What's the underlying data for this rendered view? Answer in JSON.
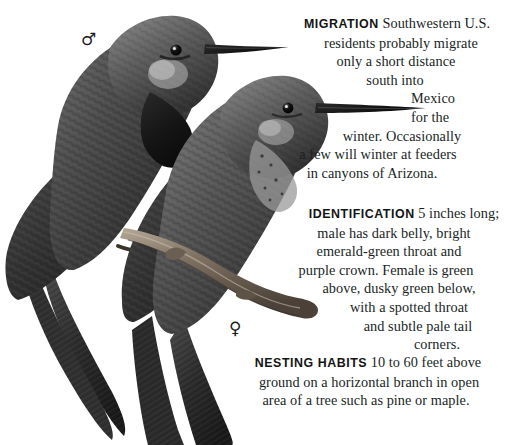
{
  "page": {
    "background_color": "#ffffff",
    "text_color": "#201f1f",
    "heading_color": "#141414"
  },
  "illustration": {
    "name": "two-hummingbirds-perched-on-branch",
    "style": "grayscale-engraving",
    "colors": {
      "feather_dark": "#2a2a2a",
      "feather_mid": "#4a4a4a",
      "feather_light": "#8e8e8e",
      "highlight": "#c9c9c9",
      "beak": "#1a1a1a",
      "branch": "#6d6257",
      "branch_light": "#a2968a",
      "eye": "#0d0d0d"
    },
    "birds": [
      {
        "label": "male",
        "symbol": "♂"
      },
      {
        "label": "female",
        "symbol": "♀"
      }
    ]
  },
  "symbols": {
    "male": "♂",
    "female": "♀"
  },
  "text_blocks": {
    "migration": {
      "lead": "MIGRATION",
      "lines": [
        "Southwestern U.S.",
        "residents probably migrate",
        "only a short distance",
        "south into",
        "Mexico",
        "for the",
        "winter. Occasionally",
        "a few will winter at feeders",
        "in canyons of Arizona."
      ],
      "full_text": "MIGRATION Southwestern U.S. residents probably migrate only a short distance south into Mexico for the winter. Occasionally a few will winter at feeders in canyons of Arizona."
    },
    "identification": {
      "lead": "IDENTIFICATION",
      "lines": [
        "5 inches long;",
        "male has dark belly, bright",
        "emerald-green throat and",
        "purple crown. Female is green",
        "above, dusky green below,",
        "with a spotted throat",
        "and subtle pale tail",
        "corners."
      ],
      "full_text": "IDENTIFICATION 5 inches long; male has dark belly, bright emerald-green throat and purple crown. Female is green above, dusky green below, with a spotted throat and subtle pale tail corners."
    },
    "nesting_habits": {
      "lead": "NESTING HABITS",
      "lines": [
        "10 to 60 feet above",
        "ground on a horizontal branch in open",
        "area of a tree such as pine or maple."
      ],
      "full_text": "NESTING HABITS 10 to 60 feet above ground on a horizontal branch in open area of a tree such as pine or maple."
    }
  }
}
